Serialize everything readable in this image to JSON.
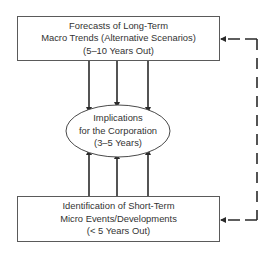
{
  "diagram": {
    "type": "flow",
    "top_box": {
      "lines": [
        "Forecasts of Long-Term",
        "Macro Trends (Alternative Scenarios)",
        "(5–10 Years Out)"
      ]
    },
    "center_node": {
      "shape": "ellipse",
      "lines": [
        "Implications",
        "for the Corporation",
        "(3–5 Years)"
      ]
    },
    "bottom_box": {
      "lines": [
        "Identification of Short-Term",
        "Micro Events/Developments",
        "(< 5 Years Out)"
      ]
    },
    "connections": [
      {
        "from": "top_box",
        "to": "center_node",
        "style": "solid",
        "count": 3
      },
      {
        "from": "bottom_box",
        "to": "center_node",
        "style": "solid",
        "count": 3
      },
      {
        "from": "external",
        "to": "top_box",
        "style": "dashed"
      },
      {
        "from": "external",
        "to": "bottom_box",
        "style": "dashed"
      }
    ],
    "colors": {
      "stroke": "#2a2a2a",
      "box_border": "#5a5a5a",
      "text": "#333333",
      "background": "#ffffff"
    }
  }
}
